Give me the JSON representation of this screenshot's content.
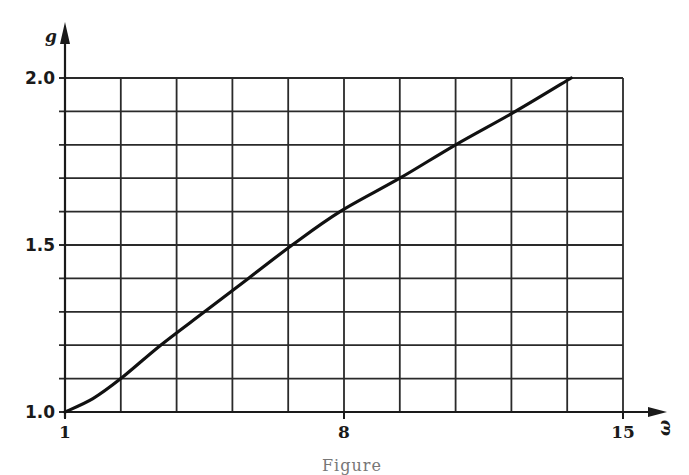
{
  "chart_data": {
    "type": "line",
    "title": "",
    "xlabel": "ω",
    "ylabel": "g",
    "xlim": [
      1,
      15
    ],
    "ylim": [
      1.0,
      2.0
    ],
    "grid": true,
    "x_ticks": [
      1,
      8,
      15
    ],
    "y_ticks": [
      1.0,
      1.5,
      2.0
    ],
    "x_tick_labels": [
      "1",
      "8",
      "15"
    ],
    "y_tick_labels": [
      "1.0",
      "1.5",
      "2.0"
    ],
    "grid_x_step": 1.4,
    "grid_y_step": 0.1,
    "series": [
      {
        "name": "g(ω)",
        "x": [
          1.0,
          1.7,
          2.4,
          3.4,
          4.5,
          5.6,
          6.7,
          7.9,
          9.4,
          10.8,
          12.3,
          13.7
        ],
        "values": [
          1.0,
          1.04,
          1.1,
          1.2,
          1.3,
          1.4,
          1.5,
          1.6,
          1.7,
          1.8,
          1.9,
          2.0
        ]
      }
    ]
  },
  "caption": "Figure"
}
